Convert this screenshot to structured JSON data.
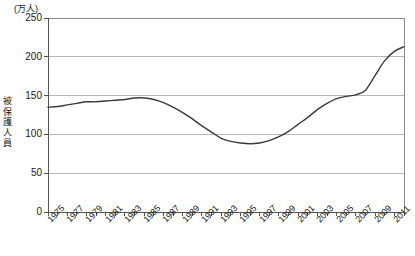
{
  "chart_data": {
    "type": "line",
    "title": "",
    "subtitle": "",
    "unit_label": "(万人)",
    "ylabel": "被保護人員",
    "xlabel": "",
    "ylim": [
      0,
      250
    ],
    "xlim": [
      1975,
      2012
    ],
    "grid": true,
    "legend": "none",
    "y_ticks": [
      250,
      200,
      150,
      100,
      50,
      0
    ],
    "y_tick_labels": [
      "250",
      "200",
      "150",
      "100",
      "50",
      "0"
    ],
    "x_tick_labels": [
      "1975",
      "1977",
      "1979",
      "1981",
      "1983",
      "1985",
      "1987",
      "1989",
      "1991",
      "1993",
      "1995",
      "1997",
      "1999",
      "2001",
      "2003",
      "2005",
      "2007",
      "2009",
      "2011"
    ],
    "x": [
      1975,
      1976,
      1977,
      1978,
      1979,
      1980,
      1981,
      1982,
      1983,
      1984,
      1985,
      1986,
      1987,
      1988,
      1989,
      1990,
      1991,
      1992,
      1993,
      1994,
      1995,
      1996,
      1997,
      1998,
      1999,
      2000,
      2001,
      2002,
      2003,
      2004,
      2005,
      2006,
      2007,
      2008,
      2009,
      2010,
      2011,
      2012
    ],
    "series": [
      {
        "name": "被保護人員",
        "color": "#3a3a3a",
        "values": [
          135,
          136,
          138,
          140,
          142,
          142,
          143,
          144,
          145,
          147,
          147,
          145,
          141,
          135,
          128,
          120,
          111,
          103,
          95,
          91,
          89,
          88,
          89,
          92,
          97,
          104,
          113,
          122,
          132,
          140,
          146,
          149,
          151,
          157,
          176,
          195,
          207,
          213
        ]
      }
    ],
    "colors": {
      "line": "#3a3a3a",
      "grid": "#b8b8b8",
      "axis": "#555555",
      "border": "#8a8a8a",
      "text": "#1a1a1a",
      "background": "#ffffff"
    }
  }
}
